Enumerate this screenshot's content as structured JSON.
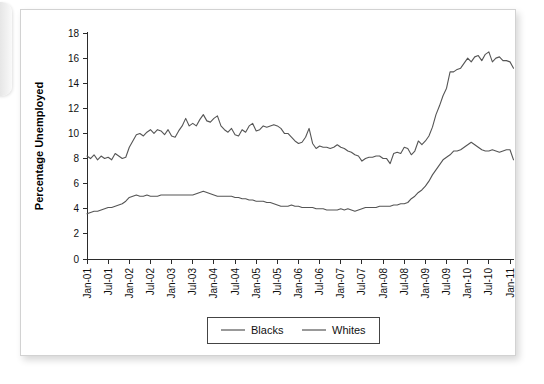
{
  "chart_data": {
    "type": "line",
    "title": "",
    "subtitle": "",
    "xlabel": "",
    "ylabel": "Percentage Unemployed",
    "ylim": [
      0,
      18
    ],
    "ytick_step": 2,
    "yticks": [
      "0",
      "2",
      "4",
      "6",
      "8",
      "10",
      "12",
      "14",
      "16",
      "18"
    ],
    "grid": false,
    "legend_position": "bottom-center",
    "legend_entries": [
      "Blacks",
      "Whites"
    ],
    "x_tick_labels": [
      "Jan-01",
      "Jul-01",
      "Jan-02",
      "Jul-02",
      "Jan-03",
      "Jul-03",
      "Jan-04",
      "Jul-04",
      "Jan-05",
      "Jul-05",
      "Jan-06",
      "Jul-06",
      "Jan-07",
      "Jul-07",
      "Jan-08",
      "Jul-08",
      "Jan-09",
      "Jul-09",
      "Jan-10",
      "Jul-10",
      "Jan-11"
    ],
    "x_label_rotation_degrees": -90,
    "x_start": "Jan-01",
    "x_end": "Feb-11",
    "x_interval": "monthly",
    "n_points": 122,
    "series": [
      {
        "name": "Blacks",
        "color": "#555555",
        "values": [
          8.2,
          8.0,
          8.3,
          7.9,
          8.2,
          8.0,
          8.1,
          7.9,
          8.4,
          8.2,
          8.0,
          8.1,
          8.9,
          9.4,
          9.9,
          10.0,
          9.8,
          10.1,
          10.3,
          10.0,
          10.3,
          10.2,
          9.9,
          10.3,
          9.8,
          9.7,
          10.2,
          10.6,
          11.2,
          10.6,
          10.8,
          10.6,
          11.1,
          11.5,
          11.0,
          10.9,
          11.2,
          11.4,
          10.6,
          10.3,
          10.1,
          10.4,
          9.9,
          9.8,
          10.3,
          10.1,
          10.6,
          10.8,
          10.2,
          10.3,
          10.6,
          10.5,
          10.6,
          10.7,
          10.6,
          10.4,
          10.0,
          10.0,
          9.7,
          9.4,
          9.2,
          9.3,
          9.7,
          10.4,
          9.2,
          8.8,
          9.0,
          8.9,
          8.9,
          8.8,
          8.9,
          9.1,
          8.9,
          8.8,
          8.6,
          8.5,
          8.3,
          8.2,
          7.8,
          8.0,
          8.1,
          8.1,
          8.2,
          8.2,
          8.0,
          8.0,
          7.6,
          8.4,
          8.5,
          8.4,
          8.9,
          8.8,
          8.3,
          8.6,
          9.4,
          9.1,
          9.4,
          9.8,
          10.5,
          11.5,
          12.2,
          13.0,
          13.6,
          14.9,
          14.9,
          15.1,
          15.2,
          15.6,
          16.0,
          15.7,
          16.1,
          16.2,
          15.8,
          16.3,
          16.5,
          15.7,
          16.0,
          16.1,
          15.8,
          15.8,
          15.7,
          15.2
        ]
      },
      {
        "name": "Whites",
        "color": "#555555",
        "values": [
          3.6,
          3.7,
          3.8,
          3.8,
          3.9,
          4.0,
          4.1,
          4.1,
          4.2,
          4.3,
          4.4,
          4.6,
          4.9,
          5.0,
          5.1,
          5.0,
          5.0,
          5.1,
          5.0,
          5.0,
          5.0,
          5.1,
          5.1,
          5.1,
          5.1,
          5.1,
          5.1,
          5.1,
          5.1,
          5.1,
          5.1,
          5.2,
          5.3,
          5.4,
          5.3,
          5.2,
          5.1,
          5.0,
          5.0,
          5.0,
          5.0,
          5.0,
          4.9,
          4.9,
          4.8,
          4.8,
          4.7,
          4.7,
          4.6,
          4.6,
          4.6,
          4.5,
          4.5,
          4.4,
          4.3,
          4.2,
          4.2,
          4.2,
          4.3,
          4.2,
          4.2,
          4.1,
          4.1,
          4.1,
          4.1,
          4.0,
          4.0,
          4.0,
          3.9,
          3.9,
          3.9,
          3.9,
          4.0,
          3.9,
          4.0,
          3.9,
          3.8,
          3.9,
          4.0,
          4.1,
          4.1,
          4.1,
          4.1,
          4.2,
          4.2,
          4.2,
          4.2,
          4.3,
          4.3,
          4.4,
          4.4,
          4.5,
          4.8,
          5.0,
          5.3,
          5.5,
          5.8,
          6.2,
          6.7,
          7.1,
          7.5,
          7.9,
          8.1,
          8.3,
          8.6,
          8.6,
          8.7,
          8.9,
          9.1,
          9.3,
          9.1,
          8.9,
          8.7,
          8.6,
          8.6,
          8.7,
          8.6,
          8.5,
          8.6,
          8.7,
          8.7,
          7.9
        ]
      }
    ]
  }
}
